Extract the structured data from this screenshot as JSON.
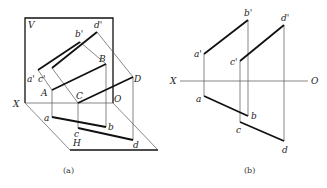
{
  "figure_a": {
    "caption": "(a)",
    "plane_labels": {
      "V": "V",
      "H": "H"
    },
    "axis_labels": {
      "X": "X",
      "O": "O"
    },
    "points_space": {
      "A": "A",
      "B": "B",
      "C": "C",
      "D": "D"
    },
    "points_front": {
      "a": "a'",
      "b": "b'",
      "c": "c'",
      "d": "d'"
    },
    "points_top": {
      "a": "a",
      "b": "b",
      "c": "c",
      "d": "d"
    }
  },
  "figure_b": {
    "caption": "(b)",
    "axis_labels": {
      "X": "X",
      "O": "O"
    },
    "points_front": {
      "a": "a'",
      "b": "b'",
      "c": "c'",
      "d": "d'"
    },
    "points_top": {
      "a": "a",
      "b": "b",
      "c": "c",
      "d": "d"
    }
  }
}
